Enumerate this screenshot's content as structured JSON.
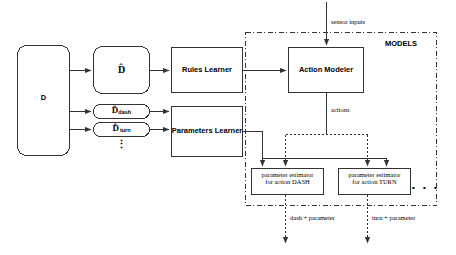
{
  "diagram": {
    "group_label": "MODELS",
    "ellipsis_vertical": "⋮",
    "ellipsis_horizontal": "• • •",
    "colors": {
      "stroke": "#333333",
      "text": "#000000",
      "background": "#ffffff"
    },
    "boxes": {
      "data_source": "D",
      "d_hat": "D̂",
      "d_hat_dash_base": "D̂",
      "d_hat_dash_sub": "dash",
      "d_hat_turn_base": "D̂",
      "d_hat_turn_sub": "turn",
      "rules_learner": "Rules Learner",
      "parameters_learner": "Parameters Learner",
      "action_modeler": "Action Modeler",
      "param_estimator_dash_line1": "parameter estimator",
      "param_estimator_dash_line2": "for action DASH",
      "param_estimator_turn_line1": "parameter estimator",
      "param_estimator_turn_line2": "for action TURN"
    },
    "edge_labels": {
      "sensor_inputs": "sensor inputs",
      "actions": "actions",
      "dash_parameter": "dash + parameter",
      "turn_parameter": "turn + parameter"
    }
  }
}
